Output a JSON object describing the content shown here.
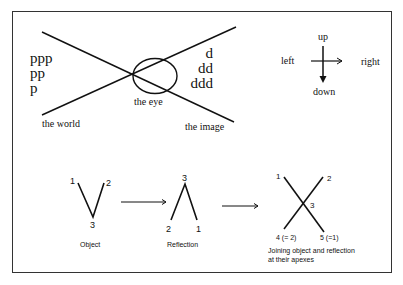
{
  "top_left": {
    "world_letters": [
      "ppp",
      "pp",
      "p"
    ],
    "image_letters": [
      "d",
      "dd",
      "ddd"
    ],
    "eye_label": "the eye",
    "world_label": "the world",
    "image_label": "the image"
  },
  "top_right": {
    "up": "up",
    "down": "down",
    "left": "left",
    "right": "right"
  },
  "bottom": {
    "object": {
      "caption": "Object",
      "labels": {
        "p1": "1",
        "p2": "2",
        "p3": "3"
      }
    },
    "reflection": {
      "caption": "Reflection",
      "labels": {
        "apex": "3",
        "left": "2",
        "right": "1"
      }
    },
    "joined": {
      "caption_line1": "Joining object and reflection",
      "caption_line2": "at their apexes",
      "labels": {
        "tl": "1",
        "tr": "2",
        "center": "3",
        "bl": "4 (= 2)",
        "br": "5 (=1)"
      }
    }
  },
  "colors": {
    "ink": "#111111",
    "frame": "#333333",
    "background": "#ffffff"
  }
}
